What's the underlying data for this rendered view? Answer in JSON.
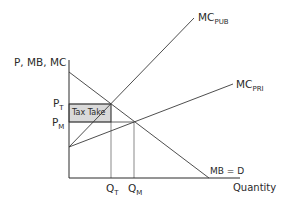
{
  "diagram": {
    "y_axis_label": "P, MB, MC",
    "x_axis_label": "Quantity",
    "curves": {
      "mc_pub": {
        "main": "MC",
        "sub": "PUB"
      },
      "mc_pri": {
        "main": "MC",
        "sub": "PRI"
      },
      "mb_d": {
        "label": "MB = D"
      }
    },
    "price_labels": {
      "p_t": {
        "main": "P",
        "sub": "T"
      },
      "p_m": {
        "main": "P",
        "sub": "M"
      }
    },
    "quantity_labels": {
      "q_t": {
        "main": "Q",
        "sub": "T"
      },
      "q_m": {
        "main": "Q",
        "sub": "M"
      }
    },
    "shaded_area_label": "Tax Take",
    "colors": {
      "line": "#3a3a3a",
      "shade": "#d9d9d9",
      "text": "#2a2a2a"
    }
  }
}
